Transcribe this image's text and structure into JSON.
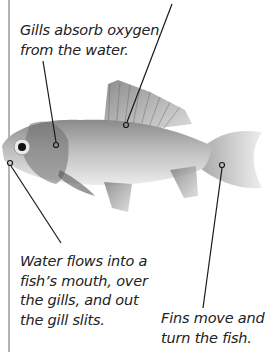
{
  "diagram": {
    "subject": "fish",
    "labels": [
      {
        "id": "top",
        "lines": [
          "Fins (cut off)"
        ]
      },
      {
        "id": "gills",
        "lines": [
          "Gills absorb oxygen",
          "from the water."
        ]
      },
      {
        "id": "mouth",
        "lines": [
          "Water flows into a",
          "fish’s mouth, over",
          "the gills, and out",
          "the gill slits."
        ]
      },
      {
        "id": "fins",
        "lines": [
          "Fins move and",
          "turn the fish."
        ]
      }
    ]
  },
  "colors": {
    "line": "#1a1a1a",
    "edge": "#b5b5b5",
    "text": "#222222"
  }
}
